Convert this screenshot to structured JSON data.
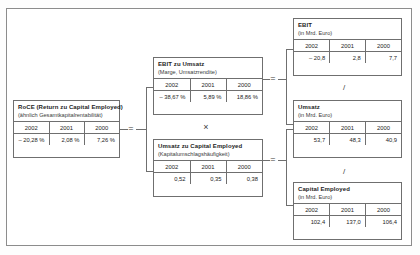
{
  "diagram": {
    "boxes": {
      "roce": {
        "title": "RoCE (Return zu Capital Employed)",
        "subtitle": "(ähnlich Gesamtkapitalrentabilität)",
        "years": [
          "2002",
          "2001",
          "2000"
        ],
        "values": [
          "– 20,28 %",
          "2,08 %",
          "7,26 %"
        ]
      },
      "ebit_zu_umsatz": {
        "title": "EBIT zu Umsatz",
        "subtitle": "(Marge, Umsatzrendite)",
        "years": [
          "2002",
          "2001",
          "2000"
        ],
        "values": [
          "– 38,67 %",
          "5,89 %",
          "18,86 %"
        ]
      },
      "umsatz_zu_capital_employed": {
        "title": "Umsatz zu Capital Employed",
        "subtitle": "(Kapitalumschlagshäufigkeit)",
        "years": [
          "2002",
          "2001",
          "2000"
        ],
        "values": [
          "0,52",
          "0,35",
          "0,38"
        ]
      },
      "ebit": {
        "title": "EBIT",
        "subtitle": "(in Mrd. Euro)",
        "years": [
          "2002",
          "2001",
          "2000"
        ],
        "values": [
          "– 20,8",
          "2,8",
          "7,7"
        ]
      },
      "umsatz": {
        "title": "Umsatz",
        "subtitle": "(in Mrd. Euro)",
        "years": [
          "2002",
          "2001",
          "2000"
        ],
        "values": [
          "53,7",
          "48,3",
          "40,9"
        ]
      },
      "capital_employed": {
        "title": "Capital Employed",
        "subtitle": "(in Mrd. Euro)",
        "years": [
          "2002",
          "2001",
          "2000"
        ],
        "values": [
          "102,4",
          "137,0",
          "106,4"
        ]
      }
    },
    "operators": {
      "equals_left": "=",
      "times_middle": "×",
      "equals_upper_right": "=",
      "equals_lower_right": "=",
      "divide_upper": "/",
      "divide_lower": "/"
    },
    "colors": {
      "border": "#6f6f6f",
      "frame": "#8c8c8c",
      "text": "#1d1d1d",
      "background": "#ffffff"
    }
  }
}
